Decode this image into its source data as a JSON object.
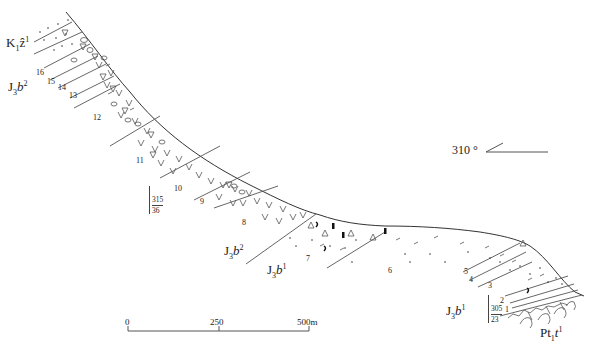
{
  "diagram": {
    "type": "geological-cross-section",
    "orientation": {
      "label": "310 °",
      "symbol": "direction-arrow"
    },
    "formations": [
      {
        "id": "K1z1",
        "prefix": "K",
        "sub": "1",
        "mid": "ẑ",
        "sup": "1",
        "position": "upper-left"
      },
      {
        "id": "J3b2_upper",
        "prefix": "J",
        "sub": "3",
        "mid": "b",
        "sup": "2",
        "position": "left"
      },
      {
        "id": "J3b2_lower",
        "prefix": "J",
        "sub": "3",
        "mid": "b",
        "sup": "2",
        "position": "center"
      },
      {
        "id": "J3b1_center",
        "prefix": "J",
        "sub": "3",
        "mid": "b",
        "sup": "1",
        "position": "center"
      },
      {
        "id": "J3b1_right",
        "prefix": "J",
        "sub": "3",
        "mid": "b",
        "sup": "1",
        "position": "lower-right"
      },
      {
        "id": "Pt11t",
        "prefix": "Pt",
        "sub": "1",
        "mid": "t",
        "sup": "1",
        "position": "lower-right"
      }
    ],
    "layers": [
      "16",
      "15",
      "14",
      "13",
      "12",
      "11",
      "10",
      "9",
      "8",
      "7",
      "6",
      "5",
      "4",
      "3",
      "2",
      "1"
    ],
    "attitudes": [
      {
        "strike": "315",
        "dip": "36"
      },
      {
        "strike": "305",
        "dip": "23"
      }
    ],
    "scale_bar": {
      "ticks": [
        "0",
        "250",
        "500m"
      ]
    },
    "lithology_symbols": [
      "dots-sandstone",
      "triangle-breccia",
      "v-volcanic",
      "oval-conglomerate",
      "dash-siltstone",
      "bar-fossil",
      "crescent-fossil",
      "granite-basement"
    ]
  }
}
